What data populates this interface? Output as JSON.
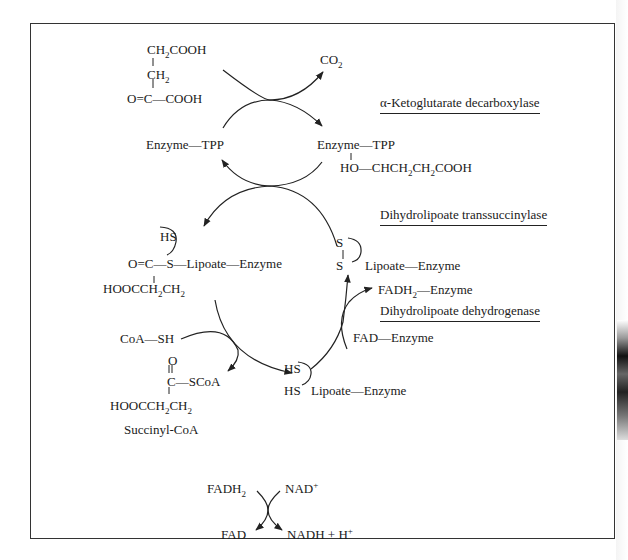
{
  "diagram": {
    "substrate": {
      "line1": "CH2COOH",
      "line2": "CH2",
      "line3": "O=C—COOH"
    },
    "co2": "CO2",
    "enzymes": {
      "e1": "α-Ketoglutarate decarboxylase",
      "e2": "Dihydrolipoate transsuccinylase",
      "e3": "Dihydrolipoate dehydrogenase"
    },
    "tpp_left": "Enzyme—TPP",
    "tpp_right": "Enzyme—TPP",
    "tpp_adduct": "HO—CHCH2CH2COOH",
    "succinyl_lipoate": {
      "hs": "HS",
      "main": "O=C—S—Lipoate—Enzyme",
      "chain": "HOOCCH2CH2"
    },
    "oxidized_lipoate": {
      "s_top": "S",
      "s_bottom": "S",
      "main": "Lipoate—Enzyme"
    },
    "reduced_lipoate": {
      "hs_top": "HS",
      "hs_bottom": "HS",
      "main": "Lipoate—Enzyme"
    },
    "fadh2_enzyme": "FADH2—Enzyme",
    "fad_enzyme": "FAD—Enzyme",
    "coa_sh": "CoA—SH",
    "succinyl_coa": {
      "o": "O",
      "c_scoa": "C—SCoA",
      "chain": "HOOCCH2CH2",
      "name": "Succinyl-CoA"
    },
    "final_reaction": {
      "fadh2": "FADH2",
      "nad": "NAD+",
      "fad": "FAD",
      "nadh": "NADH + H+"
    }
  },
  "colors": {
    "ink": "#1a1a1a",
    "background": "#ffffff",
    "frame": "#333333"
  }
}
